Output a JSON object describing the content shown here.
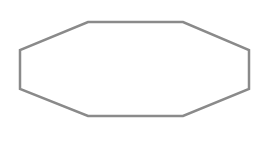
{
  "diagram": {
    "shape": "octagon",
    "points": [
      [
        88,
        22
      ],
      [
        183,
        22
      ],
      [
        249,
        50
      ],
      [
        249,
        89
      ],
      [
        183,
        116
      ],
      [
        88,
        116
      ],
      [
        20,
        89
      ],
      [
        20,
        50
      ]
    ],
    "stroke": "#8a8a8a",
    "stroke_width": 2.5,
    "fill": "#ffffff"
  }
}
